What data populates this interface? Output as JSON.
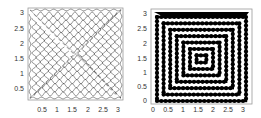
{
  "chart_data": [
    {
      "type": "line",
      "title": "",
      "xlabel": "",
      "ylabel": "",
      "xlim": [
        0.1,
        3.1
      ],
      "ylim": [
        0.1,
        3.1
      ],
      "xticks": [
        "0.5",
        "1",
        "1.5",
        "2",
        "2.5",
        "3"
      ],
      "yticks": [
        "0.5",
        "1",
        "1.5",
        "2",
        "2.5",
        "3"
      ],
      "grid": false,
      "description": "Nested wavy square spiral outline drawn with thin dark gray lines, forming a diamond lattice pattern",
      "line_color": "#333333"
    },
    {
      "type": "line",
      "title": "",
      "xlabel": "",
      "ylabel": "",
      "xlim": [
        0,
        3.14
      ],
      "ylim": [
        0,
        3.14
      ],
      "xticks": [
        "0",
        "0.5",
        "1",
        "1.5",
        "2",
        "2.5",
        "3"
      ],
      "yticks": [
        "0",
        "0.5",
        "1",
        "1.5",
        "2",
        "2.5",
        "3"
      ],
      "grid": false,
      "description": "Nested square spiral drawn with thick black beaded lines, concentric squares pattern",
      "line_color": "#000000"
    }
  ],
  "left": {
    "xticks": [
      "0.5",
      "1",
      "1.5",
      "2",
      "2.5",
      "3"
    ],
    "yticks": [
      "3",
      "2.5",
      "2",
      "1.5",
      "1",
      "0.5"
    ]
  },
  "right": {
    "xticks": [
      "0",
      "0.5",
      "1",
      "1.5",
      "2",
      "2.5",
      "3"
    ],
    "yticks": [
      "3",
      "2.5",
      "2",
      "1.5",
      "1",
      "0.5",
      "0"
    ]
  }
}
